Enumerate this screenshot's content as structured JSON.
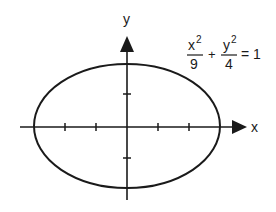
{
  "figure": {
    "axes": {
      "x_label": "x",
      "y_label": "y",
      "x_ticks": [
        -3,
        -2,
        -1,
        1,
        2,
        3
      ],
      "y_ticks": [
        -2,
        -1,
        1,
        2
      ]
    },
    "equation": {
      "term1_num": "x",
      "term1_exp": "2",
      "term1_den": "9",
      "plus": "+",
      "term2_num": "y",
      "term2_exp": "2",
      "term2_den": "4",
      "equals": "= 1"
    },
    "ellipse": {
      "a": 3,
      "b": 2,
      "center": [
        0,
        0
      ]
    },
    "colors": {
      "stroke": "#1a1a1a",
      "background": "#ffffff"
    }
  }
}
